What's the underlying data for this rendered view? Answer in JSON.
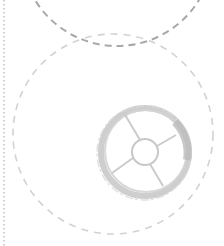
{
  "diagram": {
    "width": 224,
    "height": 246,
    "background": "#ffffff",
    "elements": [
      {
        "id": "left-dotted-line",
        "type": "line",
        "x": 4,
        "y1": 0,
        "y2": 246,
        "color": "#b0b0b0",
        "dash": "1.5 2.5"
      },
      {
        "id": "top-arc",
        "type": "circle",
        "cx": 117,
        "cy": -50,
        "r": 96,
        "color": "#a8a8a8",
        "dash": "7 5",
        "width": 2
      },
      {
        "id": "large-circle",
        "type": "circle",
        "cx": 113,
        "cy": 134,
        "r": 100,
        "color": "#d2d2d2",
        "dash": "7 6",
        "width": 1.6
      },
      {
        "id": "wheel",
        "type": "wheel-icon",
        "cx": 145,
        "cy": 152,
        "outer_r": 44,
        "hub_r": 13,
        "spokes": 5,
        "color": "#c6c6c6"
      }
    ]
  }
}
